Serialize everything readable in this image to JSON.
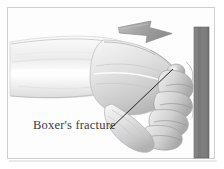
{
  "figure": {
    "type": "medical-line-illustration"
  },
  "annotation": {
    "label": "Boxer's fracture",
    "leader_line": "line from label to fifth metacarpal knuckle"
  },
  "elements": {
    "arrow_label": "motion-direction-arrow",
    "arrow_direction": "right",
    "wall_label": "impact surface",
    "hand_label": "clenched fist and forearm",
    "fracture_point_label": "fifth metacarpal neck"
  },
  "colors": {
    "background": "#ffffff",
    "plate_background": "#fdfdfd",
    "frame": "#cfcfcf",
    "arrow_fill": "#a8a8a8",
    "arrow_stroke": "#8f8f8f",
    "wall_fill": "#7e7e7e",
    "wall_stroke": "#6a6a6a",
    "skin_light": "#f4f4f4",
    "skin_mid": "#d8d8d8",
    "skin_shadow": "#b4b4b4",
    "ink": "#3a3a3a",
    "leader_line": "#262626"
  }
}
